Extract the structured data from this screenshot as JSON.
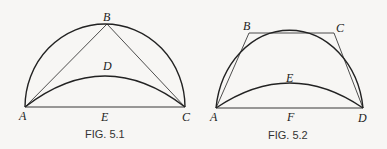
{
  "figures": [
    {
      "caption": "FIG. 5.1",
      "points": {
        "A": "A",
        "B": "B",
        "C": "C",
        "D": "D",
        "E": "E"
      }
    },
    {
      "caption": "FIG. 5.2",
      "points": {
        "A": "A",
        "B": "B",
        "C": "C",
        "D": "D",
        "E": "E",
        "F": "F"
      }
    }
  ],
  "colors": {
    "stroke": "#222222",
    "background": "#f7f6f4"
  }
}
